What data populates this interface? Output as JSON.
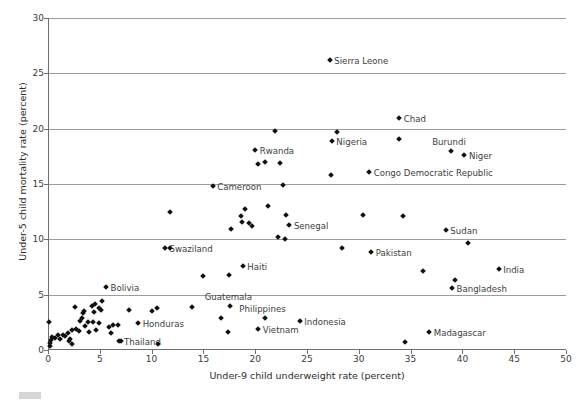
{
  "chart_data": {
    "type": "scatter",
    "title": "",
    "xlabel": "Under-9 child underweight rate (percent)",
    "ylabel": "Under-5 child mortality rate (percent)",
    "xlim": [
      0,
      50
    ],
    "ylim": [
      0,
      30
    ],
    "xticks": [
      0,
      5,
      10,
      15,
      20,
      25,
      30,
      35,
      40,
      45,
      50
    ],
    "yticks": [
      0,
      5,
      10,
      15,
      20,
      25,
      30
    ],
    "grid": "horizontal",
    "legend": "none",
    "marker": "diamond",
    "marker_color": "#111111",
    "points": [
      {
        "label": "Sierra Leone",
        "x": 27.2,
        "y": 26.2,
        "label_pos": "right"
      },
      {
        "label": "Chad",
        "x": 33.9,
        "y": 21.0,
        "label_pos": "right"
      },
      {
        "label": "Nigeria",
        "x": 27.4,
        "y": 18.9,
        "label_pos": "right"
      },
      {
        "label": "",
        "x": 27.9,
        "y": 19.7,
        "label_pos": "right"
      },
      {
        "label": "",
        "x": 33.9,
        "y": 19.1,
        "label_pos": "right"
      },
      {
        "label": "Burundi",
        "x": 38.9,
        "y": 18.0,
        "label_pos": "above"
      },
      {
        "label": "Niger",
        "x": 40.2,
        "y": 17.6,
        "label_pos": "right"
      },
      {
        "label": "Congo Democratic Republic",
        "x": 31.0,
        "y": 16.1,
        "label_pos": "right"
      },
      {
        "label": "",
        "x": 27.3,
        "y": 15.8,
        "label_pos": "right"
      },
      {
        "label": "Rwanda",
        "x": 20.0,
        "y": 18.1,
        "label_pos": "right"
      },
      {
        "label": "",
        "x": 21.9,
        "y": 19.8,
        "label_pos": "right"
      },
      {
        "label": "",
        "x": 20.9,
        "y": 17.0,
        "label_pos": "right"
      },
      {
        "label": "",
        "x": 20.3,
        "y": 16.8,
        "label_pos": "right"
      },
      {
        "label": "",
        "x": 22.4,
        "y": 16.9,
        "label_pos": "right"
      },
      {
        "label": "Cameroon",
        "x": 15.9,
        "y": 14.8,
        "label_pos": "right"
      },
      {
        "label": "",
        "x": 22.7,
        "y": 14.9,
        "label_pos": "right"
      },
      {
        "label": "",
        "x": 21.2,
        "y": 13.0,
        "label_pos": "right"
      },
      {
        "label": "",
        "x": 19.0,
        "y": 12.7,
        "label_pos": "right"
      },
      {
        "label": "",
        "x": 18.6,
        "y": 12.1,
        "label_pos": "right"
      },
      {
        "label": "",
        "x": 18.7,
        "y": 11.6,
        "label_pos": "right"
      },
      {
        "label": "Senegal",
        "x": 23.3,
        "y": 11.3,
        "label_pos": "right"
      },
      {
        "label": "",
        "x": 23.0,
        "y": 12.2,
        "label_pos": "right"
      },
      {
        "label": "",
        "x": 11.8,
        "y": 12.5,
        "label_pos": "right"
      },
      {
        "label": "",
        "x": 19.4,
        "y": 11.5,
        "label_pos": "right"
      },
      {
        "label": "",
        "x": 19.7,
        "y": 11.2,
        "label_pos": "right"
      },
      {
        "label": "",
        "x": 17.7,
        "y": 10.9,
        "label_pos": "right"
      },
      {
        "label": "",
        "x": 22.2,
        "y": 10.2,
        "label_pos": "right"
      },
      {
        "label": "",
        "x": 22.9,
        "y": 10.0,
        "label_pos": "right"
      },
      {
        "label": "Swaziland",
        "x": 11.3,
        "y": 9.2,
        "label_pos": "right"
      },
      {
        "label": "",
        "x": 11.8,
        "y": 9.2,
        "label_pos": "right"
      },
      {
        "label": "Sudan",
        "x": 38.4,
        "y": 10.8,
        "label_pos": "right"
      },
      {
        "label": "",
        "x": 30.4,
        "y": 12.2,
        "label_pos": "right"
      },
      {
        "label": "",
        "x": 34.3,
        "y": 12.1,
        "label_pos": "right"
      },
      {
        "label": "",
        "x": 40.5,
        "y": 9.7,
        "label_pos": "right"
      },
      {
        "label": "Pakistan",
        "x": 31.2,
        "y": 8.9,
        "label_pos": "right"
      },
      {
        "label": "",
        "x": 28.4,
        "y": 9.2,
        "label_pos": "right"
      },
      {
        "label": "India",
        "x": 43.5,
        "y": 7.3,
        "label_pos": "right"
      },
      {
        "label": "",
        "x": 36.2,
        "y": 7.1,
        "label_pos": "right"
      },
      {
        "label": "Bangladesh",
        "x": 39.0,
        "y": 5.6,
        "label_pos": "right"
      },
      {
        "label": "",
        "x": 39.3,
        "y": 6.3,
        "label_pos": "right"
      },
      {
        "label": "Haiti",
        "x": 18.8,
        "y": 7.6,
        "label_pos": "right"
      },
      {
        "label": "",
        "x": 17.5,
        "y": 6.8,
        "label_pos": "right"
      },
      {
        "label": "",
        "x": 15.0,
        "y": 6.7,
        "label_pos": "right"
      },
      {
        "label": "Bolivia",
        "x": 5.6,
        "y": 5.7,
        "label_pos": "right"
      },
      {
        "label": "Guatemala",
        "x": 17.6,
        "y": 4.0,
        "label_pos": "above"
      },
      {
        "label": "Philippines",
        "x": 20.9,
        "y": 2.9,
        "label_pos": "above"
      },
      {
        "label": "Vietnam",
        "x": 20.3,
        "y": 1.9,
        "label_pos": "right"
      },
      {
        "label": "Indonesia",
        "x": 24.3,
        "y": 2.6,
        "label_pos": "right"
      },
      {
        "label": "Madagascar",
        "x": 36.8,
        "y": 1.6,
        "label_pos": "right"
      },
      {
        "label": "",
        "x": 34.5,
        "y": 0.7,
        "label_pos": "right"
      },
      {
        "label": "Honduras",
        "x": 8.7,
        "y": 2.4,
        "label_pos": "right"
      },
      {
        "label": "Thailand",
        "x": 6.9,
        "y": 0.8,
        "label_pos": "right"
      },
      {
        "label": "",
        "x": 10.6,
        "y": 0.5,
        "label_pos": "right"
      },
      {
        "label": "",
        "x": 13.9,
        "y": 3.9,
        "label_pos": "right"
      },
      {
        "label": "",
        "x": 16.7,
        "y": 2.9,
        "label_pos": "right"
      },
      {
        "label": "",
        "x": 17.4,
        "y": 1.6,
        "label_pos": "right"
      },
      {
        "label": "",
        "x": 7.8,
        "y": 3.6,
        "label_pos": "right"
      },
      {
        "label": "",
        "x": 10.0,
        "y": 3.5,
        "label_pos": "right"
      },
      {
        "label": "",
        "x": 10.5,
        "y": 3.8,
        "label_pos": "right"
      },
      {
        "label": "",
        "x": 2.6,
        "y": 3.9,
        "label_pos": "right"
      },
      {
        "label": "",
        "x": 4.2,
        "y": 4.0,
        "label_pos": "right"
      },
      {
        "label": "",
        "x": 4.5,
        "y": 4.2,
        "label_pos": "right"
      },
      {
        "label": "",
        "x": 5.2,
        "y": 4.4,
        "label_pos": "right"
      },
      {
        "label": "",
        "x": 4.9,
        "y": 3.8,
        "label_pos": "right"
      },
      {
        "label": "",
        "x": 3.4,
        "y": 3.3,
        "label_pos": "right"
      },
      {
        "label": "",
        "x": 3.5,
        "y": 3.5,
        "label_pos": "right"
      },
      {
        "label": "",
        "x": 4.4,
        "y": 3.4,
        "label_pos": "right"
      },
      {
        "label": "",
        "x": 5.1,
        "y": 3.6,
        "label_pos": "right"
      },
      {
        "label": "",
        "x": 3.3,
        "y": 2.9,
        "label_pos": "right"
      },
      {
        "label": "",
        "x": 3.1,
        "y": 2.6,
        "label_pos": "right"
      },
      {
        "label": "",
        "x": 3.9,
        "y": 2.5,
        "label_pos": "right"
      },
      {
        "label": "",
        "x": 4.3,
        "y": 2.5,
        "label_pos": "right"
      },
      {
        "label": "",
        "x": 5.9,
        "y": 2.1,
        "label_pos": "right"
      },
      {
        "label": "",
        "x": 6.3,
        "y": 2.3,
        "label_pos": "right"
      },
      {
        "label": "",
        "x": 6.8,
        "y": 2.3,
        "label_pos": "right"
      },
      {
        "label": "",
        "x": 6.1,
        "y": 1.5,
        "label_pos": "right"
      },
      {
        "label": "",
        "x": 7.0,
        "y": 0.8,
        "label_pos": "right"
      },
      {
        "label": "",
        "x": 2.1,
        "y": 1.0,
        "label_pos": "right"
      },
      {
        "label": "",
        "x": 2.3,
        "y": 0.5,
        "label_pos": "right"
      },
      {
        "label": "",
        "x": 1.6,
        "y": 1.3,
        "label_pos": "right"
      },
      {
        "label": "",
        "x": 1.4,
        "y": 1.4,
        "label_pos": "right"
      },
      {
        "label": "",
        "x": 1.9,
        "y": 1.5,
        "label_pos": "right"
      },
      {
        "label": "",
        "x": 2.3,
        "y": 1.8,
        "label_pos": "right"
      },
      {
        "label": "",
        "x": 1.2,
        "y": 1.0,
        "label_pos": "right"
      },
      {
        "label": "",
        "x": 0.7,
        "y": 1.1,
        "label_pos": "right"
      },
      {
        "label": "",
        "x": 0.4,
        "y": 1.2,
        "label_pos": "right"
      },
      {
        "label": "",
        "x": 0.2,
        "y": 0.6,
        "label_pos": "right"
      },
      {
        "label": "",
        "x": 0.2,
        "y": 0.4,
        "label_pos": "right"
      },
      {
        "label": "",
        "x": 0.1,
        "y": 2.5,
        "label_pos": "right"
      },
      {
        "label": "",
        "x": 0.3,
        "y": 0.9,
        "label_pos": "right"
      },
      {
        "label": "",
        "x": 1.0,
        "y": 1.4,
        "label_pos": "right"
      },
      {
        "label": "",
        "x": 2.7,
        "y": 1.9,
        "label_pos": "right"
      },
      {
        "label": "",
        "x": 3.0,
        "y": 1.7,
        "label_pos": "right"
      },
      {
        "label": "",
        "x": 3.6,
        "y": 2.2,
        "label_pos": "right"
      },
      {
        "label": "",
        "x": 4.0,
        "y": 1.6,
        "label_pos": "right"
      },
      {
        "label": "",
        "x": 4.6,
        "y": 1.8,
        "label_pos": "right"
      },
      {
        "label": "",
        "x": 2.0,
        "y": 0.8,
        "label_pos": "right"
      },
      {
        "label": "",
        "x": 4.9,
        "y": 2.4,
        "label_pos": "right"
      }
    ]
  },
  "axes": {
    "x_title": "Under-9 child underweight rate (percent)",
    "y_title": "Under-5 child mortality rate (percent)",
    "x_tick_labels": [
      "0",
      "5",
      "10",
      "15",
      "20",
      "25",
      "30",
      "35",
      "40",
      "45",
      "50"
    ],
    "y_tick_labels": [
      "0",
      "5",
      "10",
      "15",
      "20",
      "25",
      "30"
    ]
  }
}
